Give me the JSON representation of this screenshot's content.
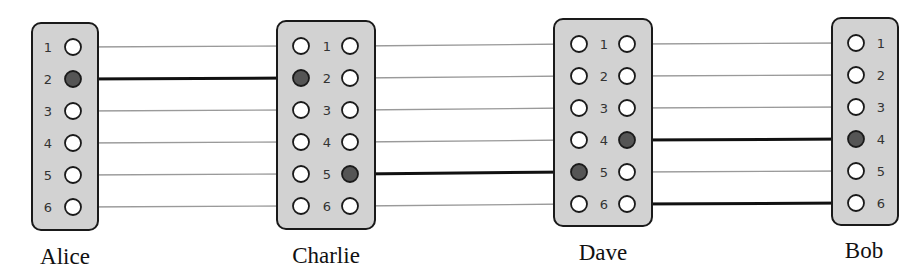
{
  "diagram": {
    "type": "patch-panel-connections",
    "nodes": [
      {
        "id": "alice",
        "label": "Alice",
        "layout": "single-left-label",
        "box": {
          "x": 32,
          "y": 23,
          "w": 66,
          "h": 207
        },
        "label_pos": {
          "x": 65,
          "y": 264
        },
        "ports_x": [
          73
        ],
        "num_x": 48,
        "rows_y": [
          47,
          79,
          111,
          143,
          175,
          207
        ],
        "filled": {
          "73": [
            2
          ]
        }
      },
      {
        "id": "charlie",
        "label": "Charlie",
        "layout": "dual",
        "box": {
          "x": 277,
          "y": 21,
          "w": 98,
          "h": 208
        },
        "label_pos": {
          "x": 326,
          "y": 263
        },
        "ports_x": [
          301,
          350
        ],
        "num_x": 327,
        "rows_y": [
          46,
          78,
          110,
          142,
          174,
          206
        ],
        "filled": {
          "301": [
            2
          ],
          "350": [
            5
          ]
        }
      },
      {
        "id": "dave",
        "label": "Dave",
        "layout": "dual",
        "box": {
          "x": 554,
          "y": 19,
          "w": 98,
          "h": 207
        },
        "label_pos": {
          "x": 603,
          "y": 260
        },
        "ports_x": [
          579,
          627
        ],
        "num_x": 604,
        "rows_y": [
          44,
          76,
          108,
          140,
          172,
          204
        ],
        "filled": {
          "579": [
            5
          ],
          "627": [
            4
          ]
        }
      },
      {
        "id": "bob",
        "label": "Bob",
        "layout": "single-right-label",
        "box": {
          "x": 832,
          "y": 18,
          "w": 66,
          "h": 207
        },
        "label_pos": {
          "x": 864,
          "y": 258
        },
        "ports_x": [
          856
        ],
        "num_x": 881,
        "rows_y": [
          43,
          75,
          107,
          139,
          171,
          203
        ],
        "filled": {
          "856": [
            4
          ]
        }
      }
    ],
    "port_numbers": [
      "1",
      "2",
      "3",
      "4",
      "5",
      "6"
    ],
    "connections_active": [
      {
        "from": "Alice:2",
        "to": "Charlie:2 (left)"
      },
      {
        "from": "Charlie:5 (right)",
        "to": "Dave:5 (left)"
      },
      {
        "from": "Dave:4 (right)",
        "to": "Bob:4"
      },
      {
        "from": "Dave:6 (right)",
        "to": "Bob:6"
      }
    ],
    "connections_inactive_note": "All other same-numbered ports linked with thin gray lines",
    "colors": {
      "box_fill": "#d2d2d2",
      "outline": "#1a1a1a",
      "filled_port": "#555555",
      "inactive_wire": "#9a9a9a",
      "active_wire": "#111111"
    }
  }
}
